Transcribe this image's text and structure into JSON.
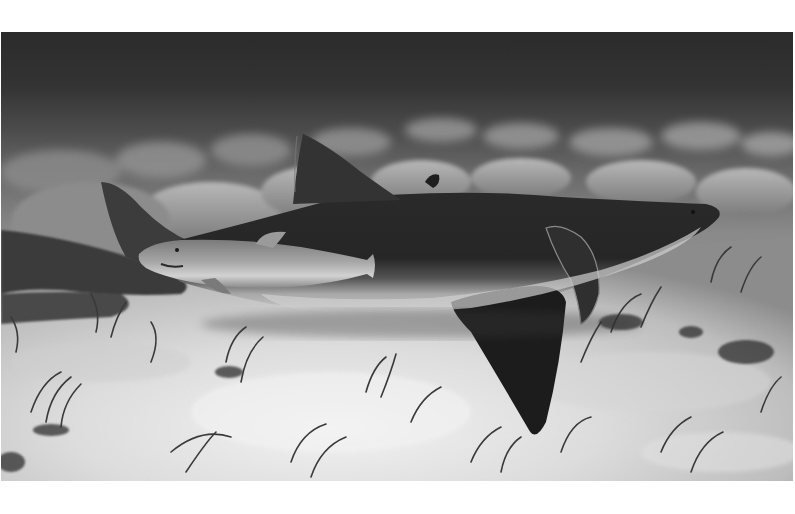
{
  "image": {
    "description": "Black-and-white underwater photograph of a large shark resting on a sandy seagrass bed with a smaller shark swimming alongside",
    "colors": {
      "page_background": "#ffffff",
      "water_top": "#2e2e2e",
      "water_mid": "#5a5a5a",
      "sand_light": "#e6e6e6",
      "sand_shadow": "#9a9a9a",
      "shark_dark": "#262626",
      "shark_belly": "#bdbdbd",
      "small_shark": "#8e8e8e",
      "seagrass": "#4a4a4a"
    },
    "subjects": [
      {
        "name": "large-shark",
        "position": "center, lying on seabed facing right"
      },
      {
        "name": "small-shark",
        "position": "left-center, alongside large shark facing left"
      },
      {
        "name": "background-shark-tail",
        "position": "far left edge"
      }
    ]
  }
}
